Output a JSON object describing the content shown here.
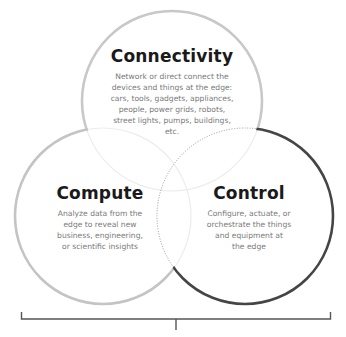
{
  "diagram": {
    "type": "venn",
    "circles": [
      {
        "id": "connectivity",
        "title": "Connectivity",
        "description_lines": [
          "Network or direct connect the",
          "devices and things at the edge:",
          "cars, tools, gadgets, appliances,",
          "people, power grids, robots,",
          "street lights, pumps, buildings,",
          "etc."
        ],
        "stroke_color": "#c8c8c8"
      },
      {
        "id": "compute",
        "title": "Compute",
        "description_lines": [
          "Analyze data from the",
          "edge to reveal new",
          "business, engineering,",
          "or scientific insights"
        ],
        "stroke_color": "#c4c4c4"
      },
      {
        "id": "control",
        "title": "Control",
        "description_lines": [
          "Configure, actuate, or",
          "orchestrate the things",
          "and equipment at",
          "the edge"
        ],
        "stroke_color": "#454545"
      }
    ],
    "bracket": {
      "color": "#555555"
    },
    "colors": {
      "title_text": "#1a1a1a",
      "body_text": "#7a7a7a",
      "inner_faint_arc": "#ececec",
      "inner_dotted_arc": "#9a9a9a"
    }
  }
}
